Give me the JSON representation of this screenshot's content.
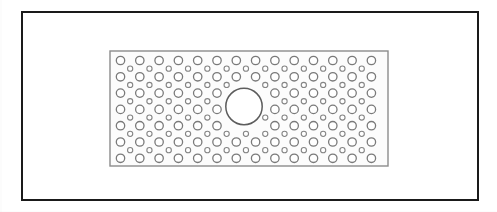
{
  "document": {
    "kind": "technical-line-drawing",
    "subject": "perforated-panel-with-central-hole"
  },
  "canvas": {
    "width": 497,
    "height": 212,
    "background_color": "#ffffff"
  },
  "outer_frame": {
    "label": "drawing-border",
    "x": 22,
    "y": 12,
    "width": 456,
    "height": 188,
    "stroke_color": "#1a1a1a",
    "stroke_width": 2,
    "fill_color": "#ffffff"
  },
  "panel": {
    "label": "perforated-panel",
    "x": 110,
    "y": 51,
    "width": 278,
    "height": 115,
    "stroke_color": "#8c8c8c",
    "stroke_width": 1.4,
    "fill_color": "#fcfcfc"
  },
  "perforation_grid": {
    "large_hole": {
      "diameter": 8.4,
      "radius": 4.2,
      "stroke_color": "#7a7a7a",
      "stroke_width": 1.3,
      "fill_color": "#ffffff",
      "columns": 14,
      "rows": 7,
      "origin_x": 120.5,
      "origin_y": 60.5,
      "pitch_x": 19.3,
      "pitch_y": 16.3
    },
    "small_hole": {
      "diameter": 5.2,
      "radius": 2.6,
      "stroke_color": "#858585",
      "stroke_width": 1.1,
      "fill_color": "#ffffff",
      "columns": 13,
      "rows": 6,
      "offset_x": 9.65,
      "offset_y": 8.15
    }
  },
  "center_hole": {
    "label": "central-bore",
    "cx": 244,
    "cy": 106.5,
    "radius": 18.2,
    "stroke_color": "#5c5c5c",
    "stroke_width": 1.5,
    "fill_color": "#ffffff",
    "clearance_radius": 22.5
  }
}
